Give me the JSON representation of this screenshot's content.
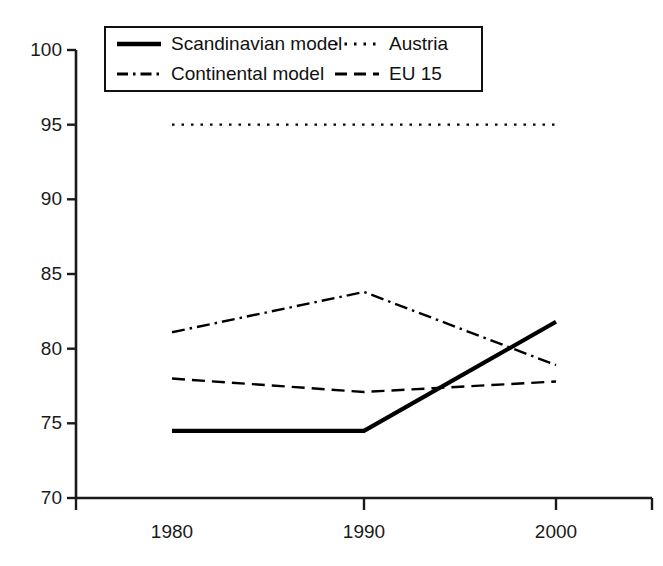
{
  "chart_data": {
    "type": "line",
    "title": "",
    "subtitle": "",
    "xlabel": "",
    "ylabel": "",
    "x": [
      1980,
      1990,
      2000
    ],
    "categories": [
      "1980",
      "1990",
      "2000"
    ],
    "xtick_labels": [
      "1980",
      "1990",
      "2000"
    ],
    "ytick_labels": [
      "100",
      "95",
      "90",
      "85",
      "80",
      "75",
      "70"
    ],
    "yticks": [
      100,
      95,
      90,
      85,
      80,
      75,
      70
    ],
    "ylim": [
      70,
      100
    ],
    "xlim": [
      1980,
      2000
    ],
    "grid": false,
    "legend_position": "top-left-inside",
    "series": [
      {
        "name": "Scandinavian model",
        "values": [
          74.5,
          74.5,
          81.8
        ],
        "style": "solid",
        "color": "#000000",
        "width": 4.2
      },
      {
        "name": "Austria",
        "values": [
          95.0,
          95.0,
          95.0
        ],
        "style": "dotted",
        "color": "#000000",
        "width": 2.4
      },
      {
        "name": "Continental model",
        "values": [
          81.1,
          83.8,
          78.9
        ],
        "style": "dashdot",
        "color": "#000000",
        "width": 2.4
      },
      {
        "name": "EU 15",
        "values": [
          78.0,
          77.1,
          77.8
        ],
        "style": "dashed",
        "color": "#000000",
        "width": 2.4
      }
    ]
  },
  "legend": {
    "entries": [
      {
        "label": "Scandinavian model",
        "style": "solid"
      },
      {
        "label": "Austria",
        "style": "dotted"
      },
      {
        "label": "Continental model",
        "style": "dashdot"
      },
      {
        "label": "EU 15",
        "style": "dashed"
      }
    ]
  },
  "axes": {
    "y_labels": [
      "100",
      "95",
      "90",
      "85",
      "80",
      "75",
      "70"
    ],
    "x_labels": [
      "1980",
      "1990",
      "2000"
    ]
  },
  "colors": {
    "line": "#000000",
    "axis": "#1a1a1a",
    "background": "#ffffff"
  }
}
